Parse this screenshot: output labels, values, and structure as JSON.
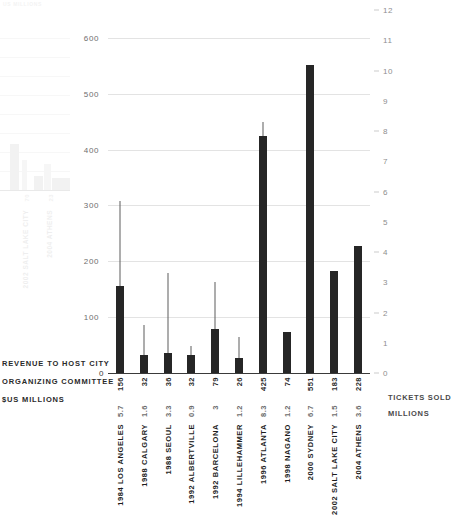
{
  "ghost": {
    "title": "US MILLIONS",
    "values": [
      "70",
      "23"
    ],
    "labels": [
      "2002 SALT LAKE CITY",
      "2004 ATHENS"
    ],
    "bar_heights": [
      46,
      14
    ],
    "ghost_secondary_heights": [
      30,
      26
    ]
  },
  "captions": {
    "left_line1": "REVENUE TO HOST CITY",
    "left_line2": "ORGANIZING COMMITTEE",
    "left_line3": "$US MILLIONS",
    "right_line1": "TICKETS SOLD",
    "right_line2": "MILLIONS",
    "zero_left": "0"
  },
  "colors": {
    "bar": "#262626",
    "whisker": "#5d5d5d",
    "grid": "#e3e3e3",
    "baseline": "#3a3a3a",
    "left_tick_text": "#6e6e6e",
    "right_tick_text": "#8e8e8e",
    "ghost": "#d6d6d6"
  },
  "chart_data": {
    "type": "bar",
    "title": "",
    "categories": [
      "1984 LOS ANGELES",
      "1988 CALGARY",
      "1988 SEOUL",
      "1992 ALBERTVILLE",
      "1992 BARCELONA",
      "1994 LILLEHAMMER",
      "1996 ATLANTA",
      "1998 NAGANO",
      "2000 SYDNEY",
      "2002 SALT LAKE CITY",
      "2004 ATHENS"
    ],
    "series": [
      {
        "name": "REVENUE TO HOST CITY ORGANIZING COMMITTEE",
        "unit": "$US MILLIONS",
        "axis": "left",
        "render": "bar",
        "values": [
          156,
          32,
          36,
          32,
          79,
          26,
          425,
          74,
          551,
          183,
          228
        ],
        "labels": [
          "156",
          "32",
          "36",
          "32",
          "79",
          "26",
          "425",
          "74",
          "551",
          "183",
          "228"
        ]
      },
      {
        "name": "TICKETS SOLD",
        "unit": "MILLIONS",
        "axis": "right",
        "render": "line-marker",
        "values": [
          5.7,
          1.6,
          3.3,
          0.9,
          3,
          1.2,
          8.3,
          1.2,
          6.7,
          1.5,
          3.6
        ],
        "labels": [
          "5.7",
          "1.6",
          "3.3",
          "0.9",
          "3",
          "1.2",
          "8.3",
          "1.2",
          "6.7",
          "1.5",
          "3.6"
        ]
      }
    ],
    "xlabel": "",
    "ylabel": "REVENUE TO HOST CITY ORGANIZING COMMITTEE $US MILLIONS",
    "y2label": "TICKETS SOLD MILLIONS",
    "ylim": [
      0,
      650
    ],
    "y2lim": [
      0,
      12
    ],
    "left_ticks": [
      "600",
      "500",
      "400",
      "300",
      "200",
      "100",
      "0"
    ],
    "left_tick_values": [
      600,
      500,
      400,
      300,
      200,
      100,
      0
    ],
    "right_ticks": [
      "12",
      "11",
      "10",
      "9",
      "8",
      "7",
      "6",
      "5",
      "4",
      "3",
      "2",
      "1",
      "0"
    ],
    "right_tick_values": [
      12,
      11,
      10,
      9,
      8,
      7,
      6,
      5,
      4,
      3,
      2,
      1,
      0
    ],
    "grid": true,
    "gridlines_at": [
      600,
      500,
      400,
      300,
      200,
      100
    ],
    "legend": "none"
  }
}
